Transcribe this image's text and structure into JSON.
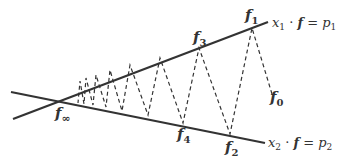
{
  "diagram": {
    "type": "budget-line-iteration",
    "lines": {
      "upper": {
        "equation": "x₁ · f = p₁",
        "x_part": "x",
        "x_sub": "1",
        "mid": " · ",
        "f_part": "f",
        "eq": " = ",
        "p_part": "p",
        "p_sub": "1"
      },
      "lower": {
        "equation": "x₂ · f = p₂",
        "x_part": "x",
        "x_sub": "2",
        "mid": " · ",
        "f_part": "f",
        "eq": " = ",
        "p_part": "p",
        "p_sub": "2"
      }
    },
    "points": {
      "f_inf": {
        "base": "f",
        "sub": "∞"
      },
      "f0": {
        "base": "f",
        "sub": "0"
      },
      "f1": {
        "base": "f",
        "sub": "1"
      },
      "f2": {
        "base": "f",
        "sub": "2"
      },
      "f3": {
        "base": "f",
        "sub": "3"
      },
      "f4": {
        "base": "f",
        "sub": "4"
      }
    },
    "colors": {
      "line": "#333333",
      "dash": "#333333",
      "text": "#333333"
    }
  }
}
